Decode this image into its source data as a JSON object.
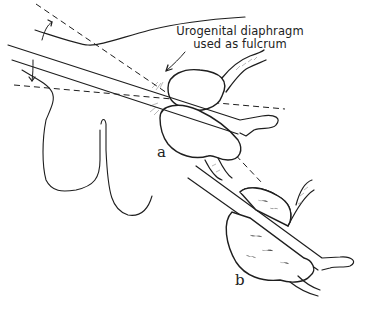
{
  "figure": {
    "type": "anatomical line illustration",
    "annotation": {
      "line1": "Urogenital diaphragm",
      "line2": "used as fulcrum"
    },
    "panel_labels": {
      "a": "a",
      "b": "b"
    },
    "colors": {
      "ink": "#1e1e1e",
      "background": "#ffffff",
      "hatching": "#8a8a8a"
    }
  }
}
